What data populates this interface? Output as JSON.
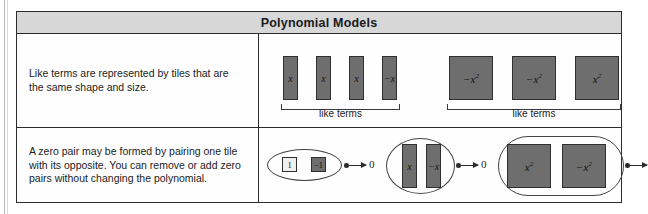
{
  "header": {
    "title": "Polynomial Models"
  },
  "rows": [
    {
      "id": "like-terms-row",
      "text": "Like terms are represented by tiles that are the same shape and size.",
      "groups": [
        {
          "id": "x-like-terms",
          "label": "like terms",
          "tiles": [
            {
              "label": "x",
              "shape": "x-tile",
              "fill": "dark"
            },
            {
              "label": "x",
              "shape": "x-tile",
              "fill": "dark"
            },
            {
              "label": "x",
              "shape": "x-tile",
              "fill": "dark"
            },
            {
              "label": "−x",
              "shape": "x-tile",
              "fill": "dark"
            }
          ]
        },
        {
          "id": "x2-like-terms",
          "label": "like terms",
          "tiles": [
            {
              "base": "−x",
              "exp": "2",
              "shape": "x2-tile",
              "fill": "dark"
            },
            {
              "base": "−x",
              "exp": "2",
              "shape": "x2-tile",
              "fill": "dark"
            },
            {
              "base": "x",
              "exp": "2",
              "shape": "x2-tile",
              "fill": "dark"
            }
          ]
        }
      ]
    },
    {
      "id": "zero-pair-row",
      "text": "A zero pair may be formed by pairing one tile with its opposite. You can remove or add zero pairs without changing the polynomial.",
      "zero_result": "0",
      "pairs": [
        {
          "id": "unit-zero-pair",
          "tiles": [
            {
              "label": "1",
              "shape": "unit-tile",
              "fill": "light"
            },
            {
              "label": "−1",
              "shape": "unit-tile",
              "fill": "dark"
            }
          ],
          "result": "0"
        },
        {
          "id": "x-zero-pair",
          "tiles": [
            {
              "label": "x",
              "shape": "x-tile",
              "fill": "dark"
            },
            {
              "label": "−x",
              "shape": "x-tile",
              "fill": "dark"
            }
          ],
          "result": "0"
        },
        {
          "id": "x2-zero-pair",
          "tiles": [
            {
              "base": "x",
              "exp": "2",
              "shape": "x2-tile",
              "fill": "dark"
            },
            {
              "base": "−x",
              "exp": "2",
              "shape": "x2-tile",
              "fill": "dark"
            }
          ],
          "result": "0"
        }
      ]
    }
  ],
  "colors": {
    "tile_dark": "#6e6e6e",
    "tile_light": "#efefef",
    "tile_border": "#2f2f2f",
    "header_band": "#d7d7d7",
    "table_border": "#2b2b2b"
  }
}
